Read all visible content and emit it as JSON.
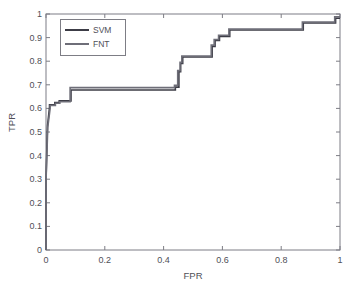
{
  "chart_data": {
    "type": "line",
    "title": "",
    "xlabel": "FPR",
    "ylabel": "TPR",
    "xlim": [
      0,
      1
    ],
    "ylim": [
      0,
      1
    ],
    "xticks": [
      "0",
      "0.2",
      "0.4",
      "0.6",
      "0.8",
      "1"
    ],
    "xtick_values": [
      0,
      0.2,
      0.4,
      0.6,
      0.8,
      1
    ],
    "yticks": [
      "0",
      "0.1",
      "0.2",
      "0.3",
      "0.4",
      "0.5",
      "0.6",
      "0.7",
      "0.8",
      "0.9",
      "1"
    ],
    "ytick_values": [
      0,
      0.1,
      0.2,
      0.3,
      0.4,
      0.5,
      0.6,
      0.7,
      0.8,
      0.9,
      1
    ],
    "grid": false,
    "legend_position": "upper-left",
    "series": [
      {
        "name": "SVM",
        "color": "#3c3c46",
        "x": [
          0,
          0,
          0.005,
          0.012,
          0.012,
          0.03,
          0.03,
          0.045,
          0.045,
          0.085,
          0.085,
          0.44,
          0.44,
          0.452,
          0.452,
          0.458,
          0.458,
          0.465,
          0.465,
          0.565,
          0.565,
          0.575,
          0.575,
          0.59,
          0.59,
          0.625,
          0.625,
          0.875,
          0.875,
          0.985,
          0.985,
          1
        ],
        "y": [
          0,
          0.295,
          0.525,
          0.605,
          0.615,
          0.615,
          0.625,
          0.625,
          0.632,
          0.632,
          0.678,
          0.678,
          0.69,
          0.69,
          0.755,
          0.755,
          0.79,
          0.79,
          0.818,
          0.818,
          0.862,
          0.862,
          0.888,
          0.888,
          0.905,
          0.905,
          0.932,
          0.932,
          0.962,
          0.962,
          0.982,
          0.982
        ]
      },
      {
        "name": "FNT",
        "color": "#6e6e78",
        "x": [
          0,
          0,
          0.006,
          0.014,
          0.014,
          0.032,
          0.032,
          0.047,
          0.047,
          0.082,
          0.082,
          0.437,
          0.437,
          0.448,
          0.448,
          0.456,
          0.456,
          0.462,
          0.462,
          0.562,
          0.562,
          0.572,
          0.572,
          0.587,
          0.587,
          0.622,
          0.622,
          0.872,
          0.872,
          0.982,
          0.982,
          1
        ],
        "y": [
          0,
          0.29,
          0.52,
          0.6,
          0.612,
          0.612,
          0.622,
          0.622,
          0.628,
          0.628,
          0.688,
          0.688,
          0.698,
          0.698,
          0.76,
          0.76,
          0.795,
          0.795,
          0.822,
          0.822,
          0.868,
          0.868,
          0.892,
          0.892,
          0.91,
          0.91,
          0.936,
          0.936,
          0.966,
          0.966,
          0.988,
          0.988
        ]
      }
    ]
  },
  "legend": {
    "entries": [
      {
        "label": "SVM",
        "color": "#3c3c46"
      },
      {
        "label": "FNT",
        "color": "#6e6e78"
      }
    ]
  },
  "axes": {
    "border_color": "#7d7d85"
  }
}
